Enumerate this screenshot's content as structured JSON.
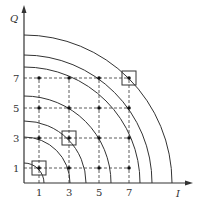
{
  "axes": {
    "x_label": "I",
    "y_label": "Q"
  },
  "ticks": {
    "x": [
      "1",
      "3",
      "5",
      "7"
    ],
    "y": [
      "1",
      "3",
      "5",
      "7"
    ]
  },
  "arc_radii_px": [
    20,
    46,
    62,
    87,
    116,
    128,
    148
  ],
  "grid_values": [
    1,
    3,
    5,
    7
  ],
  "highlighted_points": [
    [
      1,
      1
    ],
    [
      3,
      3
    ],
    [
      7,
      7
    ]
  ],
  "colors": {
    "line": "#333333",
    "point": "#111111"
  }
}
